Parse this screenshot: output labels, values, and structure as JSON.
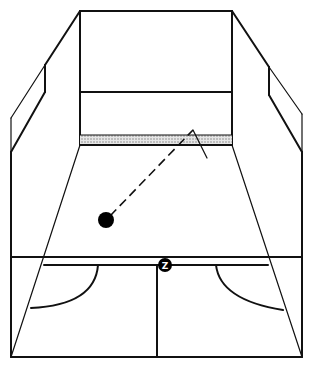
{
  "diagram": {
    "title": "",
    "colors": {
      "line": "#111111",
      "background": "#ffffff",
      "tin": "#cfcfcf",
      "ball": "#000000"
    },
    "elements": {
      "front_wall": "front-wall",
      "tin": "tin",
      "service_line": "service-line",
      "floor": "floor",
      "short_line": "short-line",
      "half_court_line": "half-court-line",
      "service_box_left": "service-box-left",
      "service_box_right": "service-box-right",
      "ball": "ball",
      "shot_path": "dashed-shot-path"
    },
    "marker": {
      "label": "Z"
    }
  }
}
